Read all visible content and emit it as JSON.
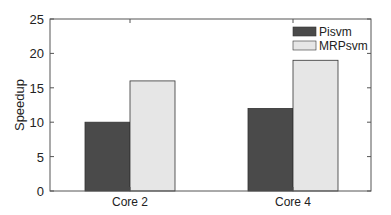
{
  "chart_data": {
    "type": "bar",
    "title": "",
    "xlabel": "",
    "ylabel": "Speedup",
    "categories": [
      "Core 2",
      "Core 4"
    ],
    "series": [
      {
        "name": "Pisvm",
        "values": [
          10,
          12
        ],
        "color": "#4a4a4a"
      },
      {
        "name": "MRPsvm",
        "values": [
          16,
          19
        ],
        "color": "#e6e6e6"
      }
    ],
    "ylim": [
      0,
      25
    ],
    "yticks": [
      0,
      5,
      10,
      15,
      20,
      25
    ],
    "grid": false,
    "legend_position": "upper right"
  }
}
